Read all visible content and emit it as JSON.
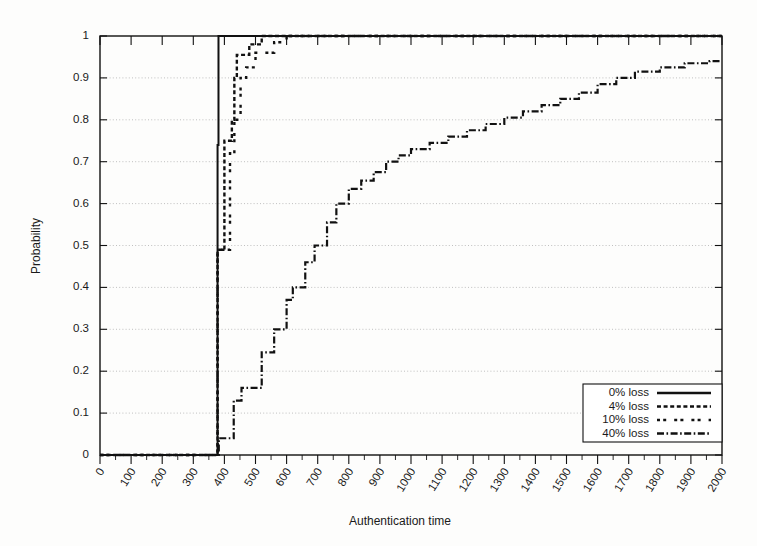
{
  "chart_data": {
    "type": "line",
    "title": "",
    "xlabel": "Authentication time",
    "ylabel": "Probability",
    "xlim": [
      0,
      2000
    ],
    "ylim": [
      0,
      1
    ],
    "grid": true,
    "legend_position": "bottom-right",
    "x_ticks": [
      0,
      100,
      200,
      300,
      400,
      500,
      600,
      700,
      800,
      900,
      1000,
      1100,
      1200,
      1300,
      1400,
      1500,
      1600,
      1700,
      1800,
      1900,
      2000
    ],
    "x_tick_labels": [
      "0",
      "100",
      "200",
      "300",
      "400",
      "500",
      "600",
      "700",
      "800",
      "900",
      "1000",
      "1100",
      "1200",
      "1300",
      "1400",
      "1500",
      "1600",
      "1700",
      "1800",
      "1900",
      "2000"
    ],
    "y_ticks": [
      0,
      0.1,
      0.2,
      0.3,
      0.4,
      0.5,
      0.6,
      0.7,
      0.8,
      0.9,
      1
    ],
    "y_tick_labels": [
      "0",
      "0.1",
      "0.2",
      "0.3",
      "0.4",
      "0.5",
      "0.6",
      "0.7",
      "0.8",
      "0.9",
      "1"
    ],
    "x_minor_tick_interval": 50,
    "series": [
      {
        "name": "0% loss",
        "dash": "solid",
        "stroke_width": 2.0,
        "points": [
          [
            0,
            0
          ],
          [
            378,
            0
          ],
          [
            378,
            0.74
          ],
          [
            381,
            0.74
          ],
          [
            381,
            1.0
          ],
          [
            2000,
            1.0
          ]
        ]
      },
      {
        "name": "4% loss",
        "dash": "dotted-dense",
        "stroke_width": 2.4,
        "points": [
          [
            0,
            0
          ],
          [
            378,
            0
          ],
          [
            378,
            0.49
          ],
          [
            400,
            0.49
          ],
          [
            400,
            0.75
          ],
          [
            424,
            0.75
          ],
          [
            424,
            0.8
          ],
          [
            432,
            0.8
          ],
          [
            432,
            0.9
          ],
          [
            440,
            0.9
          ],
          [
            440,
            0.955
          ],
          [
            480,
            0.955
          ],
          [
            480,
            0.98
          ],
          [
            520,
            0.98
          ],
          [
            520,
            1.0
          ],
          [
            2000,
            1.0
          ]
        ]
      },
      {
        "name": "10% loss",
        "dash": "dotted-sparse",
        "stroke_width": 2.4,
        "points": [
          [
            0,
            0
          ],
          [
            378,
            0
          ],
          [
            378,
            0.49
          ],
          [
            418,
            0.49
          ],
          [
            418,
            0.72
          ],
          [
            432,
            0.72
          ],
          [
            432,
            0.8
          ],
          [
            452,
            0.8
          ],
          [
            452,
            0.9
          ],
          [
            470,
            0.9
          ],
          [
            470,
            0.925
          ],
          [
            500,
            0.925
          ],
          [
            500,
            0.96
          ],
          [
            560,
            0.96
          ],
          [
            560,
            0.985
          ],
          [
            600,
            0.985
          ],
          [
            600,
            1.0
          ],
          [
            2000,
            1.0
          ]
        ]
      },
      {
        "name": "40% loss",
        "dash": "dash-dot",
        "stroke_width": 2.2,
        "points": [
          [
            0,
            0
          ],
          [
            382,
            0
          ],
          [
            382,
            0.04
          ],
          [
            430,
            0.04
          ],
          [
            430,
            0.13
          ],
          [
            455,
            0.13
          ],
          [
            455,
            0.16
          ],
          [
            520,
            0.16
          ],
          [
            520,
            0.245
          ],
          [
            560,
            0.245
          ],
          [
            560,
            0.3
          ],
          [
            600,
            0.3
          ],
          [
            600,
            0.37
          ],
          [
            620,
            0.37
          ],
          [
            620,
            0.4
          ],
          [
            660,
            0.4
          ],
          [
            660,
            0.46
          ],
          [
            690,
            0.46
          ],
          [
            690,
            0.5
          ],
          [
            730,
            0.5
          ],
          [
            730,
            0.555
          ],
          [
            760,
            0.555
          ],
          [
            760,
            0.6
          ],
          [
            800,
            0.6
          ],
          [
            800,
            0.635
          ],
          [
            840,
            0.635
          ],
          [
            840,
            0.655
          ],
          [
            880,
            0.655
          ],
          [
            880,
            0.675
          ],
          [
            920,
            0.675
          ],
          [
            920,
            0.7
          ],
          [
            960,
            0.7
          ],
          [
            960,
            0.715
          ],
          [
            1000,
            0.715
          ],
          [
            1000,
            0.73
          ],
          [
            1060,
            0.73
          ],
          [
            1060,
            0.745
          ],
          [
            1120,
            0.745
          ],
          [
            1120,
            0.76
          ],
          [
            1180,
            0.76
          ],
          [
            1180,
            0.775
          ],
          [
            1240,
            0.775
          ],
          [
            1240,
            0.79
          ],
          [
            1300,
            0.79
          ],
          [
            1300,
            0.805
          ],
          [
            1360,
            0.805
          ],
          [
            1360,
            0.82
          ],
          [
            1420,
            0.82
          ],
          [
            1420,
            0.835
          ],
          [
            1480,
            0.835
          ],
          [
            1480,
            0.85
          ],
          [
            1540,
            0.85
          ],
          [
            1540,
            0.865
          ],
          [
            1600,
            0.865
          ],
          [
            1600,
            0.885
          ],
          [
            1660,
            0.885
          ],
          [
            1660,
            0.9
          ],
          [
            1720,
            0.9
          ],
          [
            1720,
            0.915
          ],
          [
            1800,
            0.915
          ],
          [
            1800,
            0.925
          ],
          [
            1880,
            0.925
          ],
          [
            1880,
            0.935
          ],
          [
            1960,
            0.935
          ],
          [
            1960,
            0.94
          ],
          [
            2000,
            0.94
          ]
        ]
      }
    ]
  },
  "legend": {
    "entries": [
      {
        "label": "0% loss",
        "dash": "solid"
      },
      {
        "label": "4% loss",
        "dash": "dotted-dense"
      },
      {
        "label": "10% loss",
        "dash": "dotted-sparse"
      },
      {
        "label": "40% loss",
        "dash": "dash-dot"
      }
    ]
  },
  "colors": {
    "line": "#111111",
    "grid": "#b9b9b9",
    "axis": "#111111",
    "background": "#fdfdfc"
  }
}
